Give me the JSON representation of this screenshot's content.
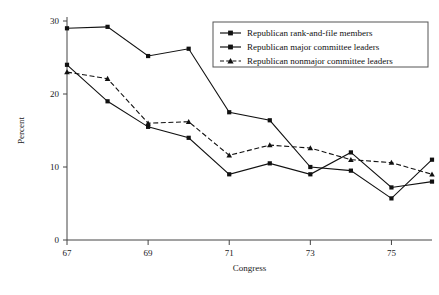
{
  "chart_data": {
    "type": "line",
    "title": "",
    "xlabel": "Congress",
    "ylabel": "Percent",
    "x": [
      67,
      68,
      69,
      70,
      71,
      72,
      73,
      74,
      75,
      76
    ],
    "xticks": [
      67,
      69,
      71,
      73,
      75
    ],
    "yticks": [
      0,
      10,
      20,
      30
    ],
    "xlim": [
      67,
      76
    ],
    "ylim": [
      0,
      30
    ],
    "grid": false,
    "legend_position": "top-right",
    "series": [
      {
        "name": "Republican rank-and-file members",
        "marker": "square",
        "linestyle": "solid",
        "color": "#111111",
        "values": [
          24.0,
          19.0,
          15.5,
          14.0,
          9.0,
          10.5,
          9.0,
          12.0,
          7.2,
          8.0
        ]
      },
      {
        "name": "Republican major committee leaders",
        "marker": "square",
        "linestyle": "solid",
        "color": "#111111",
        "values": [
          29.0,
          29.2,
          25.2,
          26.2,
          17.5,
          16.4,
          10.0,
          9.5,
          5.7,
          11.0
        ]
      },
      {
        "name": "Republican nonmajor committee leaders",
        "marker": "triangle",
        "linestyle": "dashed",
        "color": "#111111",
        "values": [
          23.0,
          22.1,
          16.0,
          16.2,
          11.6,
          13.0,
          12.6,
          11.0,
          10.6,
          9.0
        ]
      }
    ]
  },
  "legend": {
    "entries": [
      "Republican rank-and-file members",
      "Republican major committee leaders",
      "Republican nonmajor committee leaders"
    ]
  },
  "axis": {
    "y_title": "Percent",
    "x_title": "Congress",
    "y_tick_labels": [
      "0",
      "10",
      "20",
      "30"
    ],
    "x_tick_labels": [
      "67",
      "69",
      "71",
      "73",
      "75"
    ]
  }
}
